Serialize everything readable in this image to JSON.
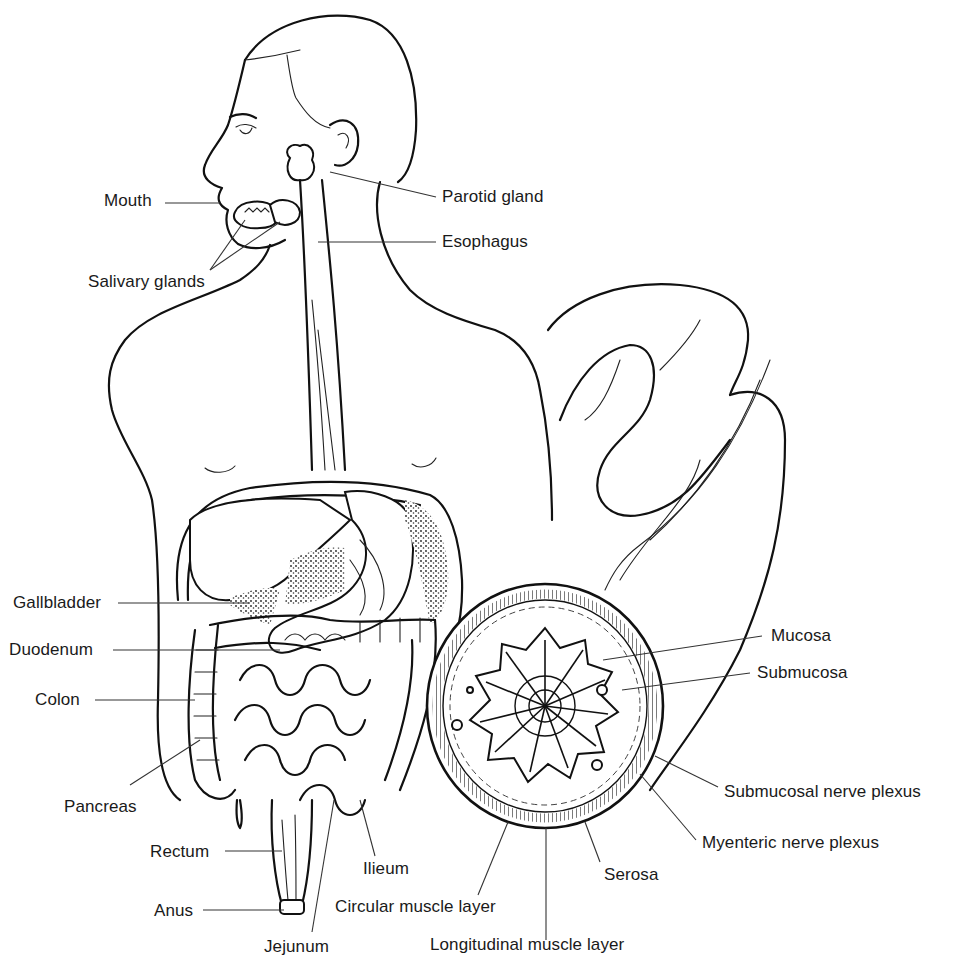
{
  "diagram": {
    "title": "",
    "style": "black-and-white line illustration",
    "colors": {
      "ink": "#111111",
      "background": "#ffffff",
      "label_text": "#1a1a1a"
    },
    "labels": {
      "mouth": "Mouth",
      "parotid_gland": "Parotid gland",
      "esophagus": "Esophagus",
      "salivary_glands": "Salivary glands",
      "gallbladder": "Gallbladder",
      "duodenum": "Duodenum",
      "colon": "Colon",
      "pancreas": "Pancreas",
      "rectum": "Rectum",
      "anus": "Anus",
      "jejunum": "Jejunum",
      "ilieum": "Ilieum",
      "circular_muscle_layer": "Circular muscle layer",
      "longitudinal_muscle_layer": "Longitudinal muscle layer",
      "serosa": "Serosa",
      "mucosa": "Mucosa",
      "submucosa": "Submucosa",
      "submucosal_nerve_plexus": "Submucosal nerve plexus",
      "myenteric_nerve_plexus": "Myenteric nerve plexus"
    }
  }
}
